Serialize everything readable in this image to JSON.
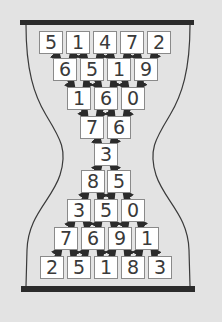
{
  "colors": {
    "background": "#e3e3e3",
    "box": "#ffffff",
    "outline": "#3a3a3a",
    "bar": "#2b2b2b",
    "arrow": "#2b2b2b"
  },
  "top_half": {
    "rows": [
      [
        "5",
        "1",
        "4",
        "7",
        "2"
      ],
      [
        "6",
        "5",
        "1",
        "9"
      ],
      [
        "1",
        "6",
        "0"
      ],
      [
        "7",
        "6"
      ]
    ],
    "arrow_direction": "down"
  },
  "center": {
    "value": "3"
  },
  "bottom_half": {
    "rows": [
      [
        "8",
        "5"
      ],
      [
        "3",
        "5",
        "0"
      ],
      [
        "7",
        "6",
        "9",
        "1"
      ],
      [
        "2",
        "5",
        "1",
        "8",
        "3"
      ]
    ],
    "arrow_direction": "up"
  }
}
